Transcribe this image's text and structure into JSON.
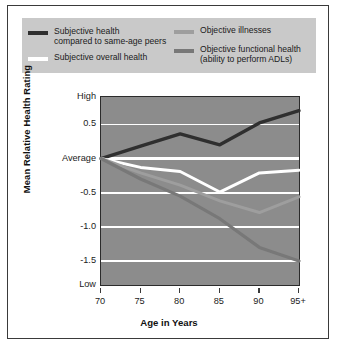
{
  "legend": {
    "items": [
      {
        "label": "Subjective health\ncompared to same-age peers",
        "color": "#2f2f2f",
        "key": "subjective_peers"
      },
      {
        "label": "Subjective overall health",
        "color": "#ffffff",
        "key": "subjective_overall"
      },
      {
        "label": "Objective illnesses",
        "color": "#9a9a9a",
        "key": "objective_illnesses"
      },
      {
        "label": "Objective functional health\n(ability to perform ADLs)",
        "color": "#7a7a7a",
        "key": "objective_functional"
      }
    ],
    "background": "#c9c9c9"
  },
  "chart_data": {
    "type": "line",
    "title": "",
    "xlabel": "Age in Years",
    "ylabel": "Mean Relative Health Rating",
    "x": [
      70,
      75,
      80,
      85,
      90,
      95
    ],
    "categories": [
      "70",
      "75",
      "80",
      "85",
      "90",
      "95+"
    ],
    "ylim": [
      -1.85,
      0.9
    ],
    "yticks": [
      0.5,
      0,
      -0.5,
      -1.0,
      -1.5
    ],
    "yticklabels": [
      "0.5",
      "Average",
      "-0.5",
      "-1.0",
      "-1.5"
    ],
    "ytick_high_label": "High",
    "ytick_low_label": "Low",
    "grid": true,
    "gridcolor": "#ffffff",
    "plot_background": "#8c8c8c",
    "legend_position": "above-plot",
    "series": [
      {
        "name": "Subjective health compared to same-age peers",
        "color": "#2f2f2f",
        "width": 3.4,
        "values": [
          0.0,
          0.18,
          0.36,
          0.2,
          0.52,
          0.7
        ]
      },
      {
        "name": "Subjective overall health",
        "color": "#ffffff",
        "width": 3.0,
        "values": [
          0.0,
          -0.13,
          -0.19,
          -0.49,
          -0.21,
          -0.17
        ]
      },
      {
        "name": "Objective illnesses",
        "color": "#9e9e9e",
        "width": 3.0,
        "values": [
          0.0,
          -0.21,
          -0.39,
          -0.62,
          -0.79,
          -0.56
        ]
      },
      {
        "name": "Objective functional health (ability to perform ADLs)",
        "color": "#787878",
        "width": 3.2,
        "values": [
          0.0,
          -0.3,
          -0.55,
          -0.88,
          -1.3,
          -1.5
        ]
      }
    ]
  }
}
